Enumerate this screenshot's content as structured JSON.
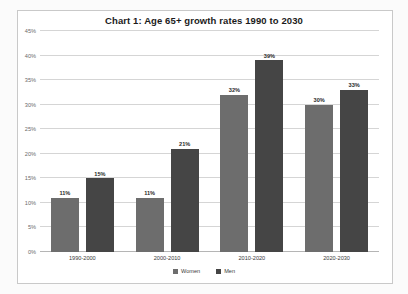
{
  "figure": {
    "title": "Chart 1: Age 65+ growth rates 1990 to 2030",
    "background_color": "#ffffff",
    "frame_color": "#c9c9c9"
  },
  "chart_data": {
    "type": "bar",
    "title": "Chart 1: Age 65+ growth rates 1990 to 2030",
    "xlabel": "",
    "ylabel": "",
    "ylim": [
      0,
      45
    ],
    "ytick_labels": [
      "0%",
      "5%",
      "10%",
      "15%",
      "20%",
      "25%",
      "30%",
      "35%",
      "40%",
      "45%"
    ],
    "ytick_values": [
      0,
      5,
      10,
      15,
      20,
      25,
      30,
      35,
      40,
      45
    ],
    "grid": true,
    "legend_position": "bottom-center",
    "categories": [
      "1990-2000",
      "2000-2010",
      "2010-2020",
      "2020-2030"
    ],
    "series": [
      {
        "name": "Women",
        "color": "#6d6d6d",
        "values": [
          11,
          11,
          32,
          30
        ],
        "data_labels": [
          "11%",
          "11%",
          "32%",
          "30%"
        ]
      },
      {
        "name": "Men",
        "color": "#454545",
        "values": [
          15,
          21,
          39,
          33
        ],
        "data_labels": [
          "15%",
          "21%",
          "39%",
          "33%"
        ]
      }
    ]
  }
}
